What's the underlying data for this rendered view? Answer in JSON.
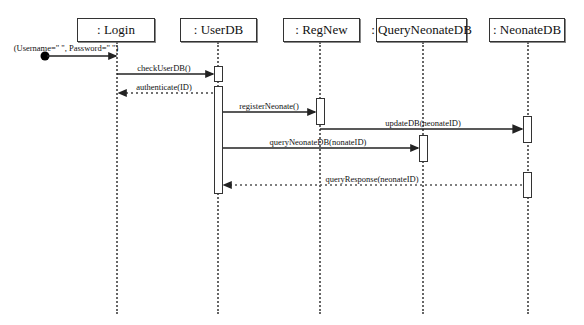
{
  "diagram": {
    "type": "sequence",
    "lifelines": [
      {
        "id": "login",
        "label": ": Login",
        "x": 117,
        "box_left": 77,
        "box_width": 78
      },
      {
        "id": "userdb",
        "label": ": UserDB",
        "x": 218,
        "box_left": 180,
        "box_width": 77
      },
      {
        "id": "regnew",
        "label": ": RegNew",
        "x": 320,
        "box_left": 283,
        "box_width": 77
      },
      {
        "id": "queryneonatedb",
        "label": ": QueryNeonateDB",
        "x": 423,
        "box_left": 376,
        "box_width": 91
      },
      {
        "id": "neonatedb",
        "label": ": NeonateDB",
        "x": 528,
        "box_left": 489,
        "box_width": 76
      }
    ],
    "initial_message": {
      "label": "(Username=\" \", Password=\" \")",
      "to": "login"
    },
    "messages": [
      {
        "label": "checkUserDB()",
        "from": "login",
        "to": "userdb",
        "style": "sync"
      },
      {
        "label": "authenticate(ID)",
        "from": "userdb",
        "to": "login",
        "style": "return"
      },
      {
        "label": "registerNeonate()",
        "from": "userdb",
        "to": "regnew",
        "style": "sync"
      },
      {
        "label": "updateDB(neonateID)",
        "from": "regnew",
        "to": "neonatedb",
        "style": "sync"
      },
      {
        "label": "queryNeonateDB(nonateID)",
        "from": "userdb",
        "to": "queryneonatedb",
        "style": "sync"
      },
      {
        "label": "queryResponse(neonateID)",
        "from": "neonatedb",
        "to": "userdb",
        "style": "return"
      }
    ]
  }
}
